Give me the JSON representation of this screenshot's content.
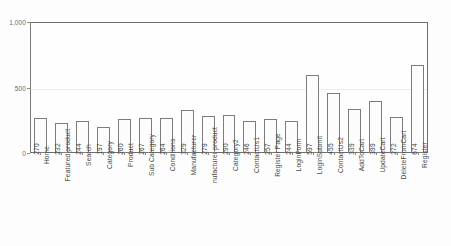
{
  "chart_data": {
    "type": "bar",
    "title": "",
    "xlabel": "",
    "ylabel": "",
    "ylim": [
      0,
      1000
    ],
    "grid": true,
    "legend": "none",
    "ytick_labels": [
      "0",
      "500",
      "1,000"
    ],
    "ytick_values": [
      0,
      500,
      1000
    ],
    "categories": [
      "Home",
      "Featured product",
      "Search",
      "Category",
      "Product",
      "Sub Category",
      "Conditions",
      "Manufacturer",
      "nufacturer product",
      "Category2",
      "ContactUs1",
      "Register Page",
      "LoginForm",
      "LoginSubmit",
      "ContactUs2",
      "AddToCart",
      "UpdateCart",
      "DeleteFromCart",
      "Register"
    ],
    "values": [
      270,
      232,
      244,
      197,
      260,
      267,
      264,
      329,
      279,
      290,
      246,
      257,
      244,
      597,
      455,
      339,
      399,
      272,
      674
    ],
    "value_labels": [
      "270",
      "232",
      "244",
      "197",
      "260",
      "267",
      "264",
      "329",
      "279",
      "290",
      "246",
      "257",
      "244",
      "597",
      "455",
      "339",
      "399",
      "272",
      "674"
    ],
    "colors": {
      "bar_fill": "#fcfcfc",
      "bar_stroke": "#7d7d7d",
      "axis": "#6d6d6d",
      "grid": "#ececec",
      "text": "#4a4a4a"
    }
  }
}
